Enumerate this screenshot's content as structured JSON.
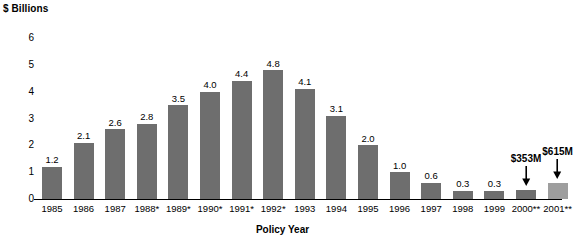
{
  "chart_data": {
    "type": "bar",
    "title": "",
    "ylabel": "$ Billions",
    "xlabel": "Policy Year",
    "ylim": [
      0,
      6
    ],
    "yticks": [
      "6",
      "5",
      "4",
      "3",
      "2",
      "1",
      "0"
    ],
    "grid": false,
    "legend": "none",
    "categories": [
      "1985",
      "1986",
      "1987",
      "1988*",
      "1989*",
      "1990*",
      "1991*",
      "1992*",
      "1993",
      "1994",
      "1995",
      "1996",
      "1997",
      "1998",
      "1999",
      "2000**",
      "2001**"
    ],
    "values": [
      1.2,
      2.1,
      2.6,
      2.8,
      3.5,
      4.0,
      4.4,
      4.8,
      4.1,
      3.1,
      2.0,
      1.0,
      0.6,
      0.3,
      0.3,
      0.353,
      0.615
    ],
    "value_labels": [
      "1.2",
      "2.1",
      "2.6",
      "2.8",
      "3.5",
      "4.0",
      "4.4",
      "4.8",
      "4.1",
      "3.1",
      "2.0",
      "1.0",
      "0.6",
      "0.3",
      "0.3",
      "",
      ""
    ],
    "bar_colors": [
      "#6e6e6e",
      "#6e6e6e",
      "#6e6e6e",
      "#6e6e6e",
      "#6e6e6e",
      "#6e6e6e",
      "#6e6e6e",
      "#6e6e6e",
      "#6e6e6e",
      "#6e6e6e",
      "#6e6e6e",
      "#6e6e6e",
      "#6e6e6e",
      "#6e6e6e",
      "#6e6e6e",
      "#6e6e6e",
      "#9e9e9e"
    ],
    "annotations": [
      {
        "category": "2000**",
        "text": "$353M"
      },
      {
        "category": "2001**",
        "text": "$615M"
      }
    ]
  },
  "colors": {
    "bar_default": "#6e6e6e",
    "bar_highlight": "#9e9e9e",
    "axis": "#000000",
    "text": "#000000",
    "background": "#ffffff"
  }
}
